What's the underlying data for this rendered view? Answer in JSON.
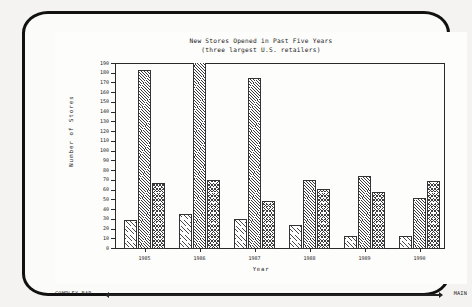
{
  "chart_data": {
    "type": "bar",
    "title": "New Stores Opened in Past Five Years",
    "subtitle": "(three largest U.S. retailers)",
    "xlabel": "Year",
    "ylabel": "Number of Stores",
    "categories": [
      "1985",
      "1986",
      "1987",
      "1988",
      "1989",
      "1990"
    ],
    "series": [
      {
        "name": "retailer-1",
        "hatch": "light-diagonal",
        "values": [
          29,
          35,
          30,
          24,
          12,
          12
        ]
      },
      {
        "name": "retailer-2",
        "hatch": "dense-diagonal",
        "values": [
          183,
          190,
          175,
          70,
          74,
          51
        ]
      },
      {
        "name": "retailer-3",
        "hatch": "herringbone",
        "values": [
          67,
          70,
          48,
          61,
          58,
          69
        ]
      }
    ],
    "ylim": [
      0,
      190
    ],
    "ytick_step": 10,
    "yticks": [
      0,
      10,
      20,
      30,
      40,
      50,
      60,
      70,
      80,
      90,
      100,
      110,
      120,
      130,
      140,
      150,
      160,
      170,
      180,
      190
    ],
    "grid": false,
    "legend": "none"
  },
  "statusbar": {
    "left_label": "COMPLEX BAR",
    "right_label": "MAIN"
  },
  "colors": {
    "ink": "#1b1b1b",
    "axis": "#2a2a2a",
    "screen": "#fdfdfc",
    "bezel": "#111111"
  }
}
